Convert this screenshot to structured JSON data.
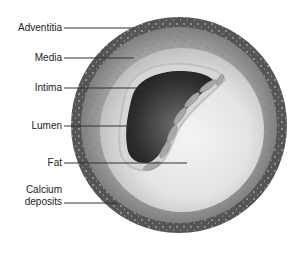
{
  "diagram": {
    "labels": [
      {
        "id": "adventitia",
        "text": "Adventitia"
      },
      {
        "id": "media",
        "text": "Media"
      },
      {
        "id": "intima",
        "text": "Intima"
      },
      {
        "id": "lumen",
        "text": "Lumen"
      },
      {
        "id": "fat",
        "text": "Fat"
      },
      {
        "id": "calcium",
        "text": "Calcium deposits",
        "line1": "Calcium",
        "line2": "deposits"
      }
    ],
    "colors": {
      "adventitia": "#5a5a5a",
      "media": "#8e8e8e",
      "intima": "#d8d8d8",
      "lumen": "#3a3a3a",
      "fat": "#e6e6e6",
      "leader_line": "#333333"
    }
  }
}
